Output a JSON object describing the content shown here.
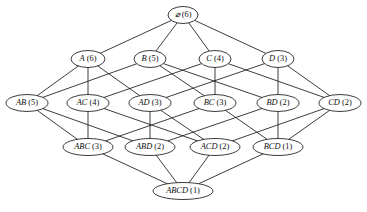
{
  "figure": {
    "background_color": "#ffffff",
    "stroke_color": "#1a1a1a",
    "width": 367,
    "height": 212
  },
  "chart_data": {
    "type": "diagram",
    "xlabel": "",
    "ylabel": "",
    "levels": [
      {
        "index": 0,
        "y": 15,
        "labels": [
          "⌀ (6)"
        ]
      },
      {
        "index": 1,
        "y": 59,
        "labels": [
          "A (6)",
          "B (5)",
          "C (4)",
          "D (3)"
        ]
      },
      {
        "index": 2,
        "y": 103,
        "labels": [
          "AB (5)",
          "AC (4)",
          "AD (3)",
          "BC (3)",
          "BD (2)",
          "CD (2)"
        ]
      },
      {
        "index": 3,
        "y": 147,
        "labels": [
          "ABC (3)",
          "ABD (2)",
          "ACD (2)",
          "BCD (1)"
        ]
      },
      {
        "index": 4,
        "y": 191,
        "labels": [
          "ABCD (1)"
        ]
      }
    ],
    "nodes": [
      {
        "id": "empty",
        "set": "⌀",
        "count": 6,
        "label": "⌀ (6)",
        "x": 183,
        "y": 15,
        "rx": 15,
        "ry": 8.5,
        "level": 0
      },
      {
        "id": "A",
        "set": "A",
        "count": 6,
        "label": "A (6)",
        "x": 88,
        "y": 59,
        "rx": 17,
        "ry": 8.5,
        "level": 1
      },
      {
        "id": "B",
        "set": "B",
        "count": 5,
        "label": "B (5)",
        "x": 150,
        "y": 59,
        "rx": 16,
        "ry": 8.5,
        "level": 1
      },
      {
        "id": "C",
        "set": "C",
        "count": 4,
        "label": "C (4)",
        "x": 215,
        "y": 59,
        "rx": 16,
        "ry": 8.5,
        "level": 1
      },
      {
        "id": "D",
        "set": "D",
        "count": 3,
        "label": "D (3)",
        "x": 278,
        "y": 59,
        "rx": 16,
        "ry": 8.5,
        "level": 1
      },
      {
        "id": "AB",
        "set": "AB",
        "count": 5,
        "label": "AB (5)",
        "x": 27,
        "y": 103,
        "rx": 21,
        "ry": 8.5,
        "level": 2
      },
      {
        "id": "AC",
        "set": "AC",
        "count": 4,
        "label": "AC (4)",
        "x": 88,
        "y": 103,
        "rx": 21,
        "ry": 8.5,
        "level": 2
      },
      {
        "id": "AD",
        "set": "AD",
        "count": 3,
        "label": "AD (3)",
        "x": 150,
        "y": 103,
        "rx": 21,
        "ry": 8.5,
        "level": 2
      },
      {
        "id": "BC",
        "set": "BC",
        "count": 3,
        "label": "BC (3)",
        "x": 215,
        "y": 103,
        "rx": 21,
        "ry": 8.5,
        "level": 2
      },
      {
        "id": "BD",
        "set": "BD",
        "count": 2,
        "label": "BD (2)",
        "x": 278,
        "y": 103,
        "rx": 21,
        "ry": 8.5,
        "level": 2
      },
      {
        "id": "CD",
        "set": "CD",
        "count": 2,
        "label": "CD (2)",
        "x": 340,
        "y": 103,
        "rx": 21,
        "ry": 8.5,
        "level": 2
      },
      {
        "id": "ABC",
        "set": "ABC",
        "count": 3,
        "label": "ABC (3)",
        "x": 88,
        "y": 147,
        "rx": 25,
        "ry": 8.5,
        "level": 3
      },
      {
        "id": "ABD",
        "set": "ABD",
        "count": 2,
        "label": "ABD (2)",
        "x": 150,
        "y": 147,
        "rx": 25,
        "ry": 8.5,
        "level": 3
      },
      {
        "id": "ACD",
        "set": "ACD",
        "count": 2,
        "label": "ACD (2)",
        "x": 215,
        "y": 147,
        "rx": 25,
        "ry": 8.5,
        "level": 3
      },
      {
        "id": "BCD",
        "set": "BCD",
        "count": 1,
        "label": "BCD (1)",
        "x": 278,
        "y": 147,
        "rx": 25,
        "ry": 8.5,
        "level": 3
      },
      {
        "id": "ABCD",
        "set": "ABCD",
        "count": 1,
        "label": "ABCD (1)",
        "x": 183,
        "y": 191,
        "rx": 30,
        "ry": 8.5,
        "level": 4
      }
    ],
    "edges": [
      {
        "from": "empty",
        "to": "A"
      },
      {
        "from": "empty",
        "to": "B"
      },
      {
        "from": "empty",
        "to": "C"
      },
      {
        "from": "empty",
        "to": "D"
      },
      {
        "from": "A",
        "to": "AB"
      },
      {
        "from": "A",
        "to": "AC"
      },
      {
        "from": "A",
        "to": "AD"
      },
      {
        "from": "B",
        "to": "AB"
      },
      {
        "from": "B",
        "to": "BC"
      },
      {
        "from": "B",
        "to": "BD"
      },
      {
        "from": "C",
        "to": "AC"
      },
      {
        "from": "C",
        "to": "BC"
      },
      {
        "from": "C",
        "to": "CD"
      },
      {
        "from": "D",
        "to": "AD"
      },
      {
        "from": "D",
        "to": "BD"
      },
      {
        "from": "D",
        "to": "CD"
      },
      {
        "from": "AB",
        "to": "ABC"
      },
      {
        "from": "AB",
        "to": "ABD"
      },
      {
        "from": "AC",
        "to": "ABC"
      },
      {
        "from": "AC",
        "to": "ACD"
      },
      {
        "from": "AD",
        "to": "ABD"
      },
      {
        "from": "AD",
        "to": "ACD"
      },
      {
        "from": "BC",
        "to": "ABC"
      },
      {
        "from": "BC",
        "to": "BCD"
      },
      {
        "from": "BD",
        "to": "ABD"
      },
      {
        "from": "BD",
        "to": "BCD"
      },
      {
        "from": "CD",
        "to": "ACD"
      },
      {
        "from": "CD",
        "to": "BCD"
      },
      {
        "from": "ABC",
        "to": "ABCD"
      },
      {
        "from": "ABD",
        "to": "ABCD"
      },
      {
        "from": "ACD",
        "to": "ABCD"
      },
      {
        "from": "BCD",
        "to": "ABCD"
      }
    ]
  }
}
